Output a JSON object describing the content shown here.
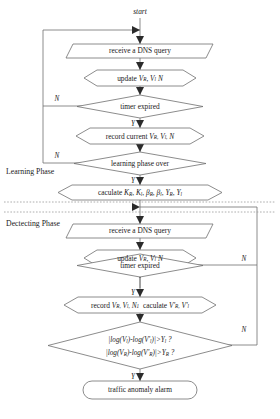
{
  "diagram": {
    "start_label": "start",
    "phases": [
      {
        "id": "learning",
        "label": "Learning Phase"
      },
      {
        "id": "detecting",
        "label": "Dectecting Phase"
      }
    ],
    "nodes": [
      {
        "id": "start",
        "shape": "label",
        "text": "start"
      },
      {
        "id": "recv1",
        "shape": "parallelogram",
        "text": "receive a DNS query"
      },
      {
        "id": "update1",
        "shape": "hexagon",
        "text": "update V_R, V_l, N"
      },
      {
        "id": "timer1",
        "shape": "diamond",
        "text": "timer expired"
      },
      {
        "id": "record1",
        "shape": "hexagon",
        "text": "record current V_R, V_l, N"
      },
      {
        "id": "phaseover",
        "shape": "diamond",
        "text": "learning phase over"
      },
      {
        "id": "caculate",
        "shape": "hexagon",
        "text": "caculate K_R, K_l, β_R, β_l, Y_R, Y_l"
      },
      {
        "id": "recv2",
        "shape": "parallelogram",
        "text": "receive a DNS query"
      },
      {
        "id": "update2",
        "shape": "hexagon",
        "text": "update V_R, V_l, N"
      },
      {
        "id": "timer2",
        "shape": "diamond",
        "text": "timer expired"
      },
      {
        "id": "record2",
        "shape": "hexagon",
        "text": "record V_R, V_l, N1  caculate V'_R, V'_l"
      },
      {
        "id": "threshold",
        "shape": "diamond",
        "text": "|log(V_l)-log(V'_l)|>Y_l ?  |log(V_R)-log(V'_R)|>Y_R ?"
      },
      {
        "id": "alarm",
        "shape": "terminator",
        "text": "traffic anomaly alarm"
      }
    ],
    "node_text": {
      "recv1": "receive a DNS query",
      "timer1": "timer expired",
      "phaseover": "learning phase over",
      "recv2": "receive a DNS query",
      "timer2": "timer expired",
      "alarm": "traffic anomaly alarm"
    },
    "branch_labels": {
      "timer1_no": "N",
      "timer1_yes": "Y",
      "phaseover_no": "N",
      "phaseover_yes": "Y",
      "timer2_no": "N",
      "timer2_yes": "Y",
      "threshold_no": "N",
      "threshold_yes": "Y"
    },
    "formulas": {
      "update_vars": {
        "base1": "V",
        "sub1": "R",
        "base2": "V",
        "sub2": "l",
        "base3": "N",
        "prefix": "update"
      },
      "record_current": {
        "prefix": "record current"
      },
      "caculate_prefix": "caculate",
      "record2_prefix": "record",
      "record2_mid": "caculate",
      "cond_l": "|log(Vₗ)-log(V′ₗ)|>Yₗ ?",
      "cond_r": "|log(Vʀ)-log(V′ʀ)|>Yʀ ?"
    },
    "colors": {
      "stroke": "#6e6e6e",
      "text": "#1a1a1a",
      "arrow": "#2b2b2b",
      "dashed": "#9a9a9a",
      "background": "#ffffff"
    }
  }
}
